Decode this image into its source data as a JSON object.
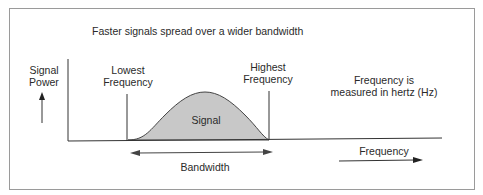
{
  "diagram": {
    "title": "Faster signals spread over a wider bandwidth",
    "y_axis_label_line1": "Signal",
    "y_axis_label_line2": "Power",
    "lowest_label_line1": "Lowest",
    "lowest_label_line2": "Frequency",
    "highest_label_line1": "Highest",
    "highest_label_line2": "Frequency",
    "note_line1": "Frequency is",
    "note_line2": "measured in hertz (Hz)",
    "signal_label": "Signal",
    "bandwidth_label": "Bandwidth",
    "x_axis_label": "Frequency",
    "colors": {
      "signal_fill": "#c8c8c8",
      "line": "#333333",
      "frame": "#9a9a9a"
    }
  }
}
